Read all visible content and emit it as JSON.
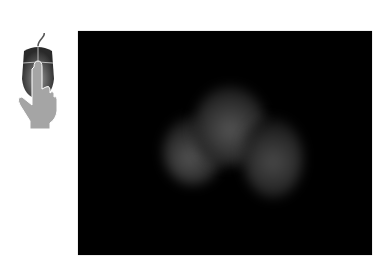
{
  "instruction_icon": "mouse-click-icon",
  "viewer": {
    "background": "#000000",
    "content": "dim-grayscale-3d-render-three-lobes",
    "lobes": [
      {
        "cx": 115,
        "cy": 120,
        "rx": 30,
        "ry": 34,
        "peak": "#4a4a4a"
      },
      {
        "cx": 152,
        "cy": 95,
        "rx": 36,
        "ry": 40,
        "peak": "#4e4e4e"
      },
      {
        "cx": 195,
        "cy": 127,
        "rx": 30,
        "ry": 40,
        "peak": "#444444"
      }
    ]
  }
}
